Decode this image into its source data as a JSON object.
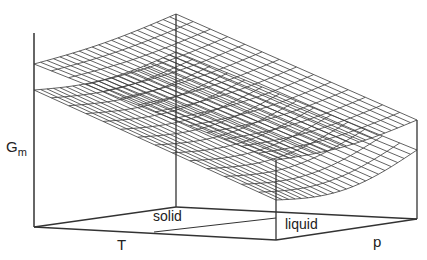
{
  "diagram": {
    "type": "3d-surface-wireframe",
    "axes": {
      "vertical_label": "G",
      "vertical_label_sub": "m",
      "x_label": "T",
      "y_label": "p"
    },
    "regions": {
      "solid_label": "solid",
      "liquid_label": "liquid"
    },
    "surfaces": [
      {
        "name": "upper-surface",
        "corners": {
          "left": [
            34,
            64
          ],
          "back": [
            176,
            14
          ],
          "right": [
            417,
            120
          ],
          "front": [
            276,
            160
          ]
        },
        "sag": 6,
        "grid": 22
      },
      {
        "name": "lower-surface",
        "corners": {
          "left": [
            34,
            90
          ],
          "back": [
            176,
            52
          ],
          "right": [
            417,
            150
          ],
          "front": [
            276,
            200
          ]
        },
        "sag": 14,
        "grid": 22
      }
    ],
    "box": {
      "floor": {
        "left": [
          34,
          227
        ],
        "back": [
          176,
          207
        ],
        "right": [
          417,
          219
        ],
        "front": [
          276,
          240
        ]
      },
      "tops": {
        "left": 33,
        "back": 14,
        "right": 120,
        "front": 160
      }
    },
    "colors": {
      "line": "#333333",
      "mesh": "#3a3a3a",
      "background": "#ffffff"
    }
  }
}
